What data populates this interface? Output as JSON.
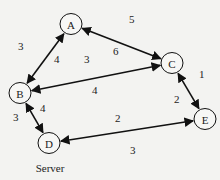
{
  "nodes": [
    {
      "id": "A",
      "label": "A",
      "x": 71,
      "y": 24
    },
    {
      "id": "B",
      "label": "B",
      "x": 20,
      "y": 93
    },
    {
      "id": "C",
      "label": "C",
      "x": 172,
      "y": 63
    },
    {
      "id": "D",
      "label": "D",
      "x": 49,
      "y": 143
    },
    {
      "id": "E",
      "label": "E",
      "x": 205,
      "y": 119
    }
  ],
  "edges": [
    {
      "from": "A",
      "to": "B",
      "bidirectional": true
    },
    {
      "from": "A",
      "to": "C",
      "bidirectional": true
    },
    {
      "from": "C",
      "to": "B",
      "bidirectional": true
    },
    {
      "from": "B",
      "to": "D",
      "bidirectional": true
    },
    {
      "from": "C",
      "to": "E",
      "bidirectional": true
    },
    {
      "from": "D",
      "to": "E",
      "bidirectional": true
    }
  ],
  "edge_labels": [
    {
      "text": "3",
      "x": 18,
      "y": 50
    },
    {
      "text": "5",
      "x": 129,
      "y": 23
    },
    {
      "text": "4",
      "x": 54,
      "y": 63
    },
    {
      "text": "3",
      "x": 84,
      "y": 63
    },
    {
      "text": "6",
      "x": 113,
      "y": 55
    },
    {
      "text": "4",
      "x": 92,
      "y": 94
    },
    {
      "text": "3",
      "x": 13,
      "y": 121
    },
    {
      "text": "4",
      "x": 40,
      "y": 112
    },
    {
      "text": "1",
      "x": 199,
      "y": 78
    },
    {
      "text": "2",
      "x": 174,
      "y": 103
    },
    {
      "text": "2",
      "x": 115,
      "y": 122
    },
    {
      "text": "3",
      "x": 130,
      "y": 154
    }
  ],
  "caption": "Server",
  "colors": {
    "stroke": "#111111",
    "background": "#f3f3f1",
    "node_fill": "#f7f7f5"
  }
}
